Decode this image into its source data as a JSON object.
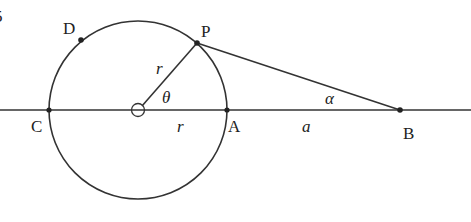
{
  "diagram": {
    "type": "geometry",
    "stroke_color": "#333333",
    "background": "#ffffff",
    "corner_glyph": "5",
    "points": {
      "C": {
        "label": "C",
        "x": 49,
        "y": 110
      },
      "A": {
        "label": "A",
        "x": 227,
        "y": 110
      },
      "P": {
        "label": "P",
        "x": 197,
        "y": 43
      },
      "D": {
        "label": "D",
        "x": 81,
        "y": 40
      },
      "B": {
        "label": "B",
        "x": 400,
        "y": 110
      },
      "O": {
        "label": "",
        "x": 138,
        "y": 110
      }
    },
    "circle": {
      "cx": 138,
      "cy": 110,
      "r": 89
    },
    "labels": {
      "radius_slanted": "r",
      "radius_horizontal": "r",
      "angle_center": "θ",
      "angle_at_B": "α",
      "segment_AB": "a"
    }
  }
}
